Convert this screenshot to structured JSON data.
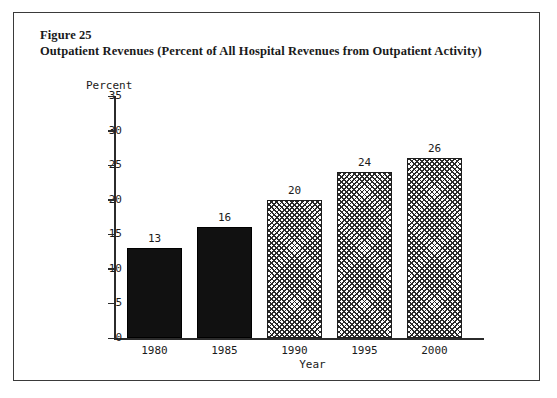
{
  "figure": {
    "label": "Figure 25",
    "title": "Outpatient Revenues (Percent of All Hospital Revenues from Outpatient Activity)"
  },
  "chart_data": {
    "type": "bar",
    "title": "Outpatient Revenues (Percent of All Hospital Revenues from Outpatient Activity)",
    "categories": [
      "1980",
      "1985",
      "1990",
      "1995",
      "2000"
    ],
    "values": [
      13,
      16,
      20,
      24,
      26
    ],
    "data_labels": [
      "13",
      "16",
      "20",
      "24",
      "26"
    ],
    "xlabel": "Year",
    "ylabel": "Percent",
    "ylim": [
      0,
      35
    ],
    "ytick_labels": [
      "0",
      "5",
      "10",
      "15",
      "20",
      "25",
      "30",
      "35"
    ],
    "ytick_values": [
      0,
      5,
      10,
      15,
      20,
      25,
      30,
      35
    ],
    "grid": false,
    "legend": false,
    "bar_styles": [
      "solid-black",
      "solid-black",
      "crosshatch",
      "crosshatch",
      "crosshatch"
    ],
    "colors": {
      "solid": "#111111",
      "hatch_line": "#2a2a2a",
      "hatch_background": "#ffffff",
      "axis": "#2b2b2b",
      "text": "#1a1a1a",
      "frame": "#3a3a3a",
      "background": "#ffffff"
    }
  }
}
